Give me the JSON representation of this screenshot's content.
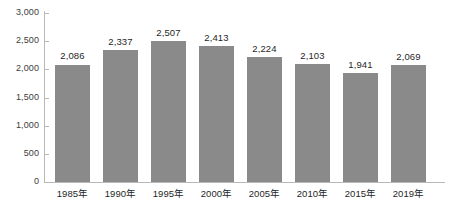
{
  "chart_data": {
    "type": "bar",
    "title": "",
    "subtitle": "",
    "xlabel": "",
    "ylabel": "",
    "categories": [
      "1985年",
      "1990年",
      "1995年",
      "2000年",
      "2005年",
      "2010年",
      "2015年",
      "2019年"
    ],
    "values": [
      2086,
      2337,
      2507,
      2413,
      2224,
      2103,
      1941,
      2069
    ],
    "value_labels": [
      "2,086",
      "2,337",
      "2,507",
      "2,413",
      "2,224",
      "2,103",
      "1,941",
      "2,069"
    ],
    "ylim": [
      0,
      3000
    ],
    "ytick_values": [
      0,
      500,
      1000,
      1500,
      2000,
      2500,
      3000
    ],
    "ytick_labels": [
      "0",
      "500",
      "1,000",
      "1,500",
      "2,000",
      "2,500",
      "3,000"
    ],
    "grid": false,
    "legend": null,
    "legend_position": "none",
    "series": [
      {
        "name": "",
        "values": [
          2086,
          2337,
          2507,
          2413,
          2224,
          2103,
          1941,
          2069
        ]
      }
    ],
    "colors": {
      "bar_fill": "#8a8a8a",
      "axis_line": "#b9b9b9",
      "tick_label": "#3c3c3c",
      "value_label": "#1f1f1f",
      "background": "#ffffff"
    }
  }
}
